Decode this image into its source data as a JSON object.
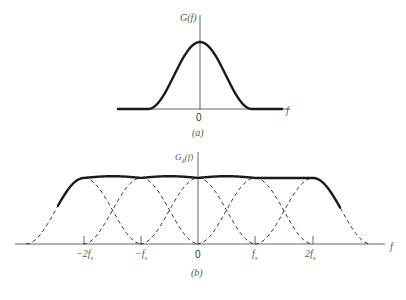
{
  "panel_a": {
    "y_label": "G(f)",
    "x_label": "f",
    "origin_label": "0",
    "caption": "(a)"
  },
  "panel_b": {
    "y_label_main": "G",
    "y_label_sub": "δ",
    "y_label_tail": "(f)",
    "x_label": "f",
    "ticks": [
      {
        "label_main": "−2f",
        "label_sub": "s"
      },
      {
        "label_main": "−f",
        "label_sub": "s"
      },
      {
        "label_main": "0",
        "label_sub": ""
      },
      {
        "label_main": "f",
        "label_sub": "s"
      },
      {
        "label_main": "2f",
        "label_sub": "s"
      }
    ],
    "caption": "(b)"
  },
  "colors": {
    "curve": "#1a1a1a",
    "axis": "#444444",
    "text": "#555555"
  }
}
